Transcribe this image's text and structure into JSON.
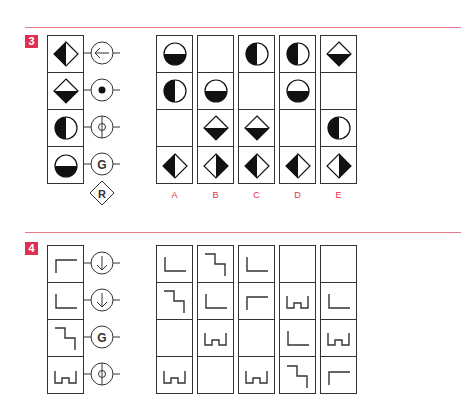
{
  "problems": [
    {
      "number": "3",
      "stem": [
        "diamond-left-black",
        "diamond-bottom-black",
        "circle-left-black",
        "circle-bottom-black"
      ],
      "operators": [
        {
          "type": "arrow-left",
          "label": ""
        },
        {
          "type": "dot",
          "label": ""
        },
        {
          "type": "phi",
          "label": ""
        },
        {
          "type": "letter",
          "label": "G"
        }
      ],
      "extra_operator": {
        "type": "diamond-letter",
        "label": "R"
      },
      "options": [
        {
          "label": "A",
          "cells": [
            "circle-bottom-black",
            "circle-left-black",
            "empty",
            "diamond-left-black"
          ]
        },
        {
          "label": "B",
          "cells": [
            "empty",
            "circle-bottom-black",
            "diamond-bottom-black",
            "diamond-right-black"
          ]
        },
        {
          "label": "C",
          "cells": [
            "circle-left-black",
            "empty",
            "diamond-bottom-black",
            "diamond-left-black"
          ]
        },
        {
          "label": "D",
          "cells": [
            "circle-left-black",
            "circle-bottom-black",
            "empty",
            "diamond-left-black"
          ]
        },
        {
          "label": "E",
          "cells": [
            "diamond-bottom-black",
            "empty",
            "circle-left-black",
            "diamond-right-black"
          ]
        }
      ]
    },
    {
      "number": "4",
      "stem": [
        "corner-top-left",
        "corner-bottom-left",
        "step-down",
        "castle"
      ],
      "operators": [
        {
          "type": "arrow-down",
          "label": ""
        },
        {
          "type": "arrow-down",
          "label": ""
        },
        {
          "type": "letter",
          "label": "G"
        },
        {
          "type": "phi",
          "label": ""
        }
      ],
      "options": [
        {
          "label": "",
          "cells": [
            "corner-bottom-left",
            "step-down",
            "empty",
            "castle"
          ]
        },
        {
          "label": "",
          "cells": [
            "step-down",
            "corner-bottom-left",
            "castle",
            "empty"
          ]
        },
        {
          "label": "",
          "cells": [
            "corner-bottom-left",
            "corner-top-left",
            "empty",
            "castle"
          ]
        },
        {
          "label": "",
          "cells": [
            "empty",
            "castle",
            "corner-bottom-left",
            "step-down"
          ]
        },
        {
          "label": "",
          "cells": [
            "empty",
            "corner-bottom-left",
            "castle",
            "corner-top-left"
          ]
        }
      ]
    }
  ],
  "colors": {
    "accent": "#e0304f",
    "rule": "#e8798c",
    "ink": "#333333",
    "fill": "#111111"
  }
}
